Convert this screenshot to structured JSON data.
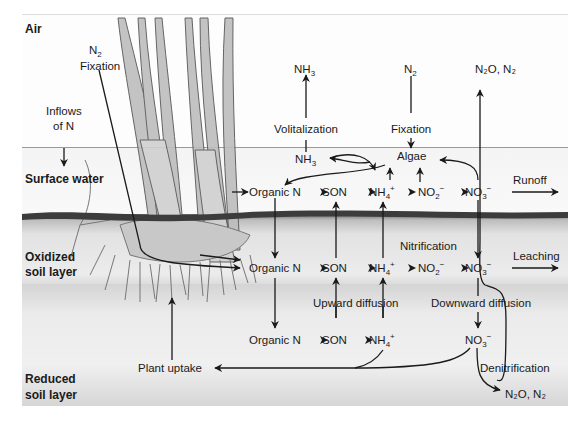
{
  "zones": {
    "air": "Air",
    "surface_water": "Surface water",
    "oxidized_1": "Oxidized",
    "oxidized_2": "soil layer",
    "reduced_1": "Reduced",
    "reduced_2": "soil layer"
  },
  "air_labels": {
    "n2_fixation_n": "N",
    "n2_fixation_sub": "2",
    "n2_fixation_label": "Fixation",
    "inflows_1": "Inflows",
    "inflows_2": "of N",
    "nh3_top": "NH",
    "nh3_top_sub": "3",
    "volitalization": "Volitalization",
    "n2_top": "N",
    "n2_top_sub": "2",
    "fixation": "Fixation",
    "n2o_n2_top": "N₂O, N₂"
  },
  "surface_water": {
    "nh3": "NH",
    "nh3_sub": "3",
    "algae": "Algae",
    "organic_n": "Organic N",
    "son": "SON",
    "nh4": "NH",
    "nh4_sub": "4",
    "nh4_sup": "+",
    "no2": "NO",
    "no2_sub": "2",
    "no2_sup": "−",
    "no3": "NO",
    "no3_sub": "3",
    "no3_sup": "−",
    "runoff": "Runoff"
  },
  "oxidized_soil": {
    "nitrification": "Nitrification",
    "organic_n": "Organic N",
    "son": "SON",
    "nh4": "NH",
    "nh4_sub": "4",
    "nh4_sup": "+",
    "no2": "NO",
    "no2_sub": "2",
    "no2_sup": "−",
    "no3": "NO",
    "no3_sub": "3",
    "no3_sup": "−",
    "leaching": "Leaching",
    "upward_diffusion": "Upward diffusion",
    "downward_diffusion": "Downward diffusion"
  },
  "reduced_soil": {
    "organic_n": "Organic N",
    "son": "SON",
    "nh4": "NH",
    "nh4_sub": "4",
    "nh4_sup": "+",
    "no3": "NO",
    "no3_sub": "3",
    "no3_sup": "−",
    "plant_uptake": "Plant uptake",
    "denitrification": "Denitrification",
    "n2o_n2_bottom": "N₂O, N₂"
  },
  "colors": {
    "ink": "#1a1a1a",
    "plant": "#8a8a8a",
    "soil_dark": "#3c3c3c"
  }
}
